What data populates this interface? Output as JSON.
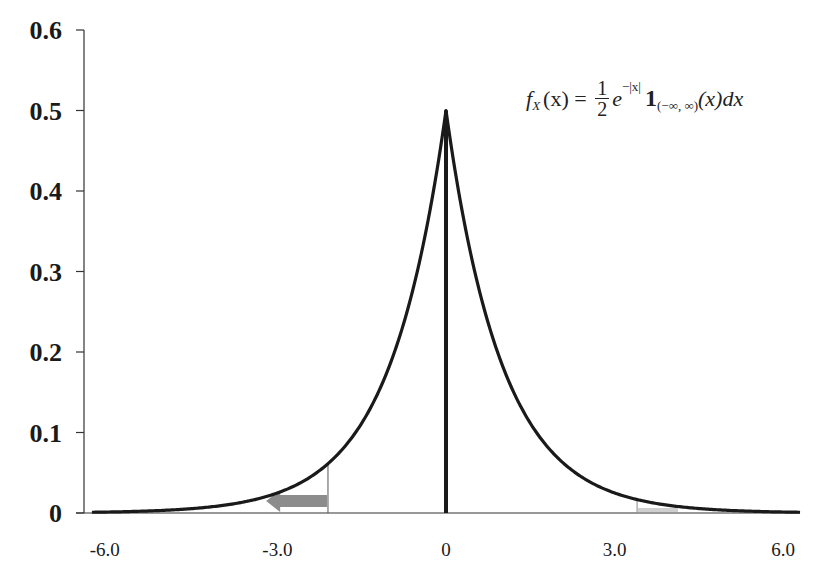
{
  "chart_data": {
    "type": "line",
    "title": "",
    "xlabel": "",
    "ylabel": "",
    "series": [
      {
        "name": "Laplace density f_X(x) = 1/2 e^{-|x|}",
        "x": [
          -6.5,
          -6.0,
          -5.5,
          -5.0,
          -4.5,
          -4.0,
          -3.5,
          -3.0,
          -2.5,
          -2.0,
          -1.5,
          -1.0,
          -0.5,
          -0.25,
          0,
          0.25,
          0.5,
          1.0,
          1.5,
          2.0,
          2.5,
          3.0,
          3.5,
          4.0,
          4.5,
          5.0,
          5.5,
          6.0,
          6.5
        ],
        "values": [
          0.0008,
          0.0012,
          0.002,
          0.0034,
          0.0056,
          0.0092,
          0.0151,
          0.0249,
          0.041,
          0.0677,
          0.1116,
          0.1839,
          0.3033,
          0.3894,
          0.5,
          0.3894,
          0.3033,
          0.1839,
          0.1116,
          0.0677,
          0.041,
          0.0249,
          0.0151,
          0.0092,
          0.0056,
          0.0034,
          0.002,
          0.0012,
          0.0008
        ]
      }
    ],
    "x_ticks": [
      -6.0,
      -3.0,
      0,
      3.0,
      6.0
    ],
    "x_tick_labels": [
      "-6.0",
      "-3.0",
      "0",
      "3.0",
      "6.0"
    ],
    "y_ticks": [
      0,
      0.1,
      0.2,
      0.3,
      0.4,
      0.5,
      0.6
    ],
    "y_tick_labels": [
      "0",
      "0.1",
      "0.2",
      "0.3",
      "0.4",
      "0.5",
      "0.6"
    ],
    "xlim": [
      -6.5,
      6.5
    ],
    "ylim": [
      0,
      0.6
    ],
    "grid": false,
    "legend": null,
    "annotations": [
      {
        "type": "vertical-line",
        "x": 0,
        "note": "thick bar at mean"
      },
      {
        "type": "shaded-tail",
        "side": "left",
        "from": -6.5,
        "to": -2.1,
        "note": "vertical marker at x≈-2.1 with gray arrow pointing left"
      },
      {
        "type": "shaded-tail",
        "side": "right",
        "from": 3.4,
        "to": 6.5,
        "note": "vertical marker at x≈3.4 with light gray fill"
      },
      {
        "type": "formula",
        "text": "f_X(x) = (1/2) e^{-|x|} 1_{(-∞,∞)}(x) dx"
      }
    ]
  },
  "formula": {
    "f": "f",
    "sub_X": "X",
    "arg": "(x)",
    "eq": " = ",
    "num": "1",
    "den": "2",
    "e": "e",
    "exp": "−|x|",
    "one": "1",
    "indicator_sub": "(−∞, ∞)",
    "tail": "(x)dx"
  },
  "colors": {
    "curve": "#1a1a1a",
    "axis": "#333333",
    "arrow": "#8c8c8c",
    "right_fill": "#cfcfcf"
  }
}
